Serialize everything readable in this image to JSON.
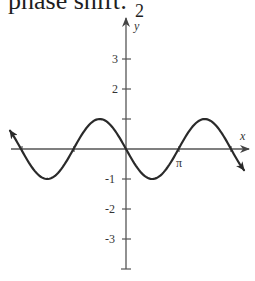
{
  "header": {
    "caption_text": "phase shift:",
    "fraction_denominator": "2"
  },
  "chart_data": {
    "type": "line",
    "title": "",
    "function": "y = -sin(x)",
    "xlabel": "x",
    "ylabel": "y",
    "x_tick_labels": [
      "π"
    ],
    "y_tick_labels": [
      "3",
      "2",
      "1",
      "-1",
      "-2",
      "-3"
    ],
    "y_ticks": [
      3,
      2,
      1,
      -1,
      -2,
      -3
    ],
    "xlim": [
      -3.5,
      3.7
    ],
    "ylim": [
      -4,
      4.4
    ],
    "grid": false,
    "legend": null,
    "series": [
      {
        "name": "-sin(x)",
        "x": [
          -3.14159,
          -2.35619,
          -1.5708,
          -0.7854,
          0,
          0.7854,
          1.5708,
          2.35619,
          3.14159
        ],
        "values": [
          0,
          0.707,
          1,
          0.707,
          0,
          -0.707,
          -1,
          -0.707,
          0
        ]
      }
    ],
    "annotations": [
      "π marked at x-axis zero crossing",
      "curve ends with arrows on both sides"
    ],
    "colors": {
      "curve": "#2a2a2a",
      "axes": "#555555"
    }
  }
}
